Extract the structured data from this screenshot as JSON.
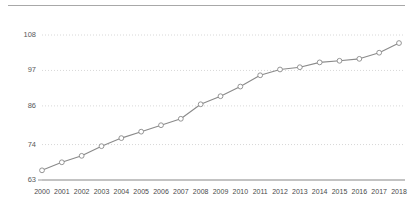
{
  "chart_data": {
    "type": "line",
    "title": "",
    "subtitle": "",
    "xlabel": "",
    "ylabel": "",
    "categories": [
      "2000",
      "2001",
      "2002",
      "2003",
      "2004",
      "2005",
      "2006",
      "2007",
      "2008",
      "2009",
      "2010",
      "2011",
      "2012",
      "2013",
      "2014",
      "2015",
      "2016",
      "2017",
      "2018"
    ],
    "values": [
      66.0,
      68.5,
      70.5,
      73.5,
      76.0,
      78.0,
      80.0,
      82.0,
      86.5,
      89.0,
      92.0,
      95.5,
      97.3,
      98.0,
      99.5,
      100.0,
      100.6,
      102.5,
      105.5
    ],
    "series": [
      {
        "name": "",
        "values": [
          66.0,
          68.5,
          70.5,
          73.5,
          76.0,
          78.0,
          80.0,
          82.0,
          86.5,
          89.0,
          92.0,
          95.5,
          97.3,
          98.0,
          99.5,
          100.0,
          100.6,
          102.5,
          105.5
        ]
      }
    ],
    "yticks": [
      63,
      74,
      86,
      97,
      108
    ],
    "ytick_labels": [
      "63",
      "74",
      "86",
      "97",
      "108"
    ],
    "ylim": [
      63,
      108
    ],
    "xlim": [
      "2000",
      "2018"
    ],
    "grid": true,
    "grid_axis": "y",
    "grid_style": "dotted",
    "legend": false,
    "legend_position": "none",
    "marker": "circle-open",
    "line_color": "#8a8a8a",
    "marker_fill": "#ffffff",
    "marker_stroke": "#8a8a8a",
    "grid_color": "#d8d8d8",
    "axis_color": "#9a9a9a",
    "tick_label_color": "#4a4a4a",
    "background": "#ffffff"
  }
}
